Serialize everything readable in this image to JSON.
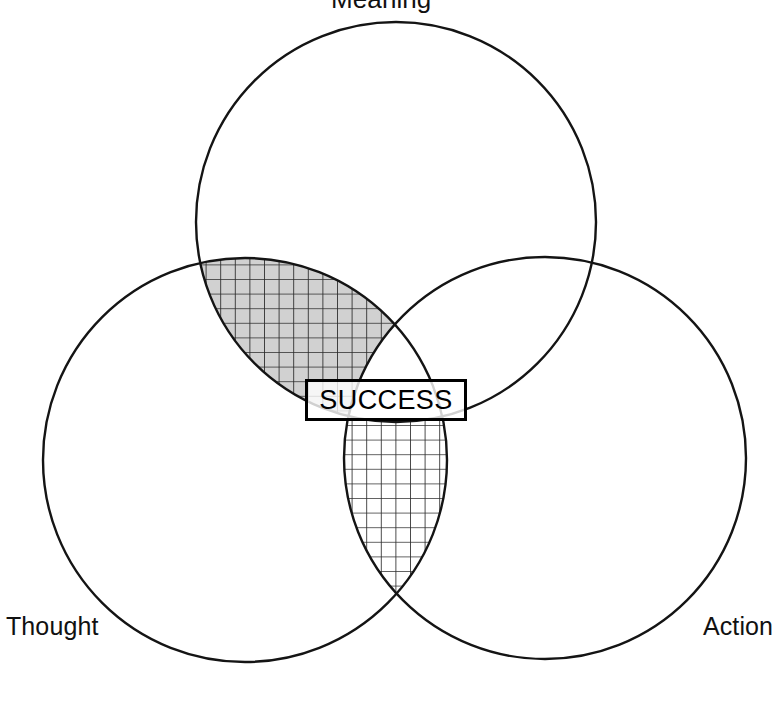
{
  "diagram": {
    "type": "venn",
    "title_visible": false,
    "background_color": "#ffffff",
    "stroke_color": "#111111",
    "width": 776,
    "height": 709,
    "sets": [
      {
        "id": "meaning",
        "label": "Meaning",
        "label_position": "top",
        "fill_style": "dark-noise-texture",
        "fill_color": "#111111",
        "center_x": 396,
        "center_y": 222,
        "radius": 200
      },
      {
        "id": "thought",
        "label": "Thought",
        "label_position": "bottom-left",
        "fill_style": "fine-grid-hatch",
        "fill_color": "#ffffff",
        "center_x": 245,
        "center_y": 460,
        "radius": 202
      },
      {
        "id": "action",
        "label": "Action",
        "label_position": "bottom-right",
        "fill_style": "none",
        "fill_color": "#ffffff",
        "center_x": 545,
        "center_y": 458,
        "radius": 201
      }
    ],
    "intersections": [
      {
        "id": "meaning-action",
        "sets": [
          "meaning",
          "action"
        ],
        "fill_style": "mid-gray",
        "fill_color": "#a0a0a0"
      },
      {
        "id": "meaning-thought",
        "sets": [
          "meaning",
          "thought"
        ],
        "fill_style": "mid-gray-with-grid",
        "fill_color": "#a0a0a0"
      },
      {
        "id": "thought-action",
        "sets": [
          "thought",
          "action"
        ],
        "fill_style": "fine-grid-hatch",
        "fill_color": "#ffffff"
      },
      {
        "id": "meaning-thought-action",
        "sets": [
          "meaning",
          "thought",
          "action"
        ],
        "fill_style": "mid-gray-with-grid",
        "fill_color": "#a0a0a0"
      }
    ],
    "center_callout": {
      "id": "success",
      "label": "SUCCESS",
      "boxed": true,
      "border_color": "#000000",
      "text_color": "#000000"
    }
  }
}
